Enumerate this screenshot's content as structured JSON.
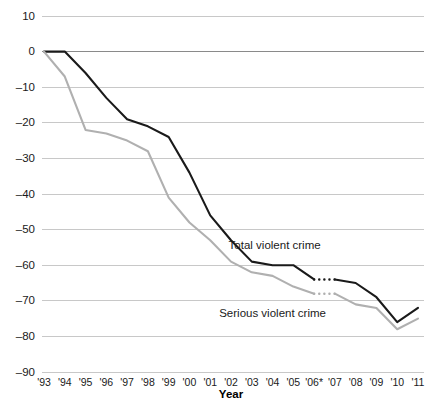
{
  "chart_data": {
    "type": "line",
    "title": "",
    "subtitle": "",
    "xlabel": "Year",
    "ylabel": "",
    "xlim": [
      1993,
      2011
    ],
    "ylim": [
      -90,
      10
    ],
    "grid": true,
    "legend_position": "inline-annotations",
    "x": [
      1993,
      1994,
      1995,
      1996,
      1997,
      1998,
      1999,
      2000,
      2001,
      2002,
      2003,
      2004,
      2005,
      2006,
      2007,
      2008,
      2009,
      2010,
      2011
    ],
    "xtick_labels": [
      "'93",
      "'94",
      "'95",
      "'96",
      "'97",
      "'98",
      "'99",
      "'00",
      "'01",
      "'02",
      "'03",
      "'04",
      "'05",
      "'06*",
      "'07",
      "'08",
      "'09",
      "'10",
      "'11"
    ],
    "ytick_labels": [
      "10",
      "0",
      "-10",
      "-20",
      "-30",
      "-40",
      "-50",
      "-60",
      "-70",
      "-80",
      "-90"
    ],
    "ytick_values": [
      10,
      0,
      -10,
      -20,
      -30,
      -40,
      -50,
      -60,
      -70,
      -80,
      -90
    ],
    "series": [
      {
        "name": "Total violent crime",
        "color": "#1a1a1a",
        "label_x": 2004.1,
        "label_y": -55.5,
        "values": [
          0,
          0,
          -6,
          -13,
          -19,
          -21,
          -24,
          -34,
          -46,
          -53,
          -59,
          -60,
          -60,
          -64,
          -64,
          -65,
          -69,
          -76,
          -72
        ],
        "break_between": [
          2006,
          2007
        ]
      },
      {
        "name": "Serious violent crime",
        "color": "#b0b0b0",
        "label_x": 2004.0,
        "label_y": -74.5,
        "values": [
          0,
          -7,
          -22,
          -23,
          -25,
          -28,
          -41,
          -48,
          -53,
          -59,
          -62,
          -63,
          -66,
          -68,
          -68,
          -71,
          -72,
          -78,
          -75
        ],
        "break_between": [
          2006,
          2007
        ]
      }
    ],
    "notes": {
      "asterisk_year": "'06*"
    }
  },
  "colors": {
    "total_violent_crime": "#1a1a1a",
    "serious_violent_crime": "#b0b0b0",
    "gridline": "#c8c8c8",
    "zeroline": "#8a8a8a",
    "background": "#ffffff",
    "text": "#1a1a1a"
  }
}
